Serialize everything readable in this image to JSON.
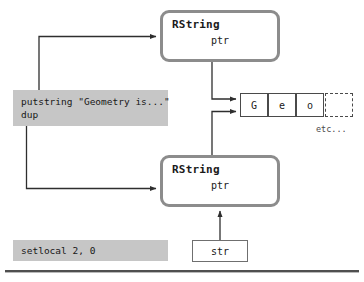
{
  "diagram": {
    "colors": {
      "code_block_bg": "#c6c6c6",
      "rstring_border": "#8c8c8c",
      "arrow": "#333333",
      "cell_border": "#4a4a4a",
      "rule": "#4f4f4f"
    },
    "objects": [
      {
        "name": "RString",
        "field": "ptr",
        "position": "top"
      },
      {
        "name": "RString",
        "field": "ptr",
        "position": "bottom"
      }
    ],
    "code_blocks": [
      {
        "id": "putstring-block",
        "lines": [
          "putstring \"Geometry is...\"",
          "dup"
        ]
      },
      {
        "id": "setlocal-block",
        "lines": [
          "setlocal 2, 0"
        ]
      }
    ],
    "string_buffer": {
      "cells": [
        "G",
        "e",
        "o"
      ],
      "trailing_cell_style": "dashed",
      "trailing_label": "etc..."
    },
    "variable": {
      "label": "str"
    }
  }
}
